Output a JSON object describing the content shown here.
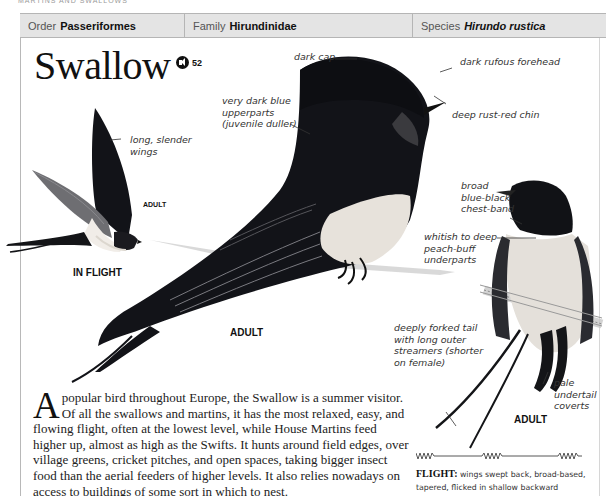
{
  "running_head": "MARTINS AND SWALLOWS",
  "taxonomy": {
    "order": {
      "label": "Order",
      "value": "Passeriformes"
    },
    "family": {
      "label": "Family",
      "value": "Hirundinidae"
    },
    "species": {
      "label": "Species",
      "value": "Hirundo rustica"
    }
  },
  "title": "Swallow",
  "audio": {
    "icon": "speaker-icon",
    "track": "52"
  },
  "annotations": {
    "long_slender_wings": [
      "long, slender",
      "wings"
    ],
    "very_dark_blue": [
      "very dark blue",
      "upperparts",
      "(juvenile duller)"
    ],
    "dark_cap": "dark cap",
    "dark_rufous_forehead": "dark rufous forehead",
    "deep_rust_red_chin": "deep rust-red chin",
    "chest_band": [
      "broad",
      "blue-black",
      "chest-band"
    ],
    "underparts": [
      "whitish to deep",
      "peach-buff",
      "underparts"
    ],
    "forked_tail": [
      "deeply forked tail",
      "with long outer",
      "streamers (shorter",
      "on female)"
    ],
    "undertail": [
      "pale",
      "undertail",
      "coverts"
    ]
  },
  "captions": {
    "flight_adult": "ADULT",
    "in_flight": "IN FLIGHT",
    "main_adult": "ADULT",
    "front_adult": "ADULT"
  },
  "body": {
    "drop_cap": "A",
    "text": " popular bird throughout Europe, the Swallow is a summer visitor. Of all the swallows and martins, it has the most relaxed, easy, and flowing flight, often at the lowest level, while House Martins feed higher up, almost as high as the Swifts. It hunts around field edges, over village greens, cricket pitches, and open spaces, taking bigger insect food than the aerial feeders of higher levels. It also relies nowadays on access to buildings of some sort in which to nest."
  },
  "flight": {
    "heading": "FLIGHT:",
    "text": " wings swept back, broad-based, tapered, flicked in shallow backward wingbeats; fluent and"
  },
  "colors": {
    "header_bg": "#e4e4e4",
    "border": "#b5b5b5",
    "bird_dark": "#111318",
    "bird_light": "#e8e4df"
  }
}
